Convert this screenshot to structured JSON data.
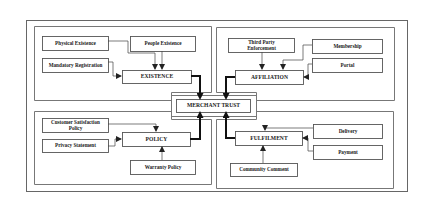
{
  "diagram": {
    "center": {
      "id": "merchant_trust",
      "label": "MERCHANT TRUST"
    },
    "dimensions": [
      {
        "id": "existence",
        "label": "EXISTENCE",
        "quadrant": "top-left",
        "factors": [
          {
            "id": "physical_existence",
            "label": "Physical Existence"
          },
          {
            "id": "people_existence",
            "label": "People Existence"
          },
          {
            "id": "mandatory_registration",
            "label": "Mandatory Registration"
          }
        ]
      },
      {
        "id": "affiliation",
        "label": "AFFILIATION",
        "quadrant": "top-right",
        "factors": [
          {
            "id": "third_party_enforcement",
            "label_lines": [
              "Third Party",
              "Enforcement"
            ]
          },
          {
            "id": "membership",
            "label": "Membership"
          },
          {
            "id": "portal",
            "label": "Portal"
          }
        ]
      },
      {
        "id": "policy",
        "label": "POLICY",
        "quadrant": "bottom-left",
        "factors": [
          {
            "id": "customer_satisfaction_policy",
            "label_lines": [
              "Customer Satisfaction",
              "Policy"
            ]
          },
          {
            "id": "privacy_statement",
            "label": "Privacy Statement"
          },
          {
            "id": "warranty_policy",
            "label": "Warranty Policy"
          }
        ]
      },
      {
        "id": "fulfilment",
        "label": "FULFILMENT",
        "quadrant": "bottom-right",
        "factors": [
          {
            "id": "delivery",
            "label": "Delivery"
          },
          {
            "id": "payment",
            "label": "Payment"
          },
          {
            "id": "community_comment",
            "label": "Community Comment"
          }
        ]
      }
    ],
    "edges": [
      {
        "from": "physical_existence",
        "to": "existence"
      },
      {
        "from": "people_existence",
        "to": "existence"
      },
      {
        "from": "mandatory_registration",
        "to": "existence"
      },
      {
        "from": "third_party_enforcement",
        "to": "affiliation"
      },
      {
        "from": "membership",
        "to": "affiliation"
      },
      {
        "from": "portal",
        "to": "affiliation"
      },
      {
        "from": "customer_satisfaction_policy",
        "to": "policy"
      },
      {
        "from": "privacy_statement",
        "to": "policy"
      },
      {
        "from": "warranty_policy",
        "to": "policy"
      },
      {
        "from": "delivery",
        "to": "fulfilment"
      },
      {
        "from": "payment",
        "to": "fulfilment"
      },
      {
        "from": "community_comment",
        "to": "fulfilment"
      },
      {
        "from": "existence",
        "to": "merchant_trust",
        "style": "thick"
      },
      {
        "from": "affiliation",
        "to": "merchant_trust",
        "style": "thick"
      },
      {
        "from": "policy",
        "to": "merchant_trust",
        "style": "thick"
      },
      {
        "from": "fulfilment",
        "to": "merchant_trust",
        "style": "thick"
      }
    ],
    "colors": {
      "line": "#333333",
      "frame": "#555555",
      "text": "#222222",
      "background": "#ffffff"
    }
  }
}
